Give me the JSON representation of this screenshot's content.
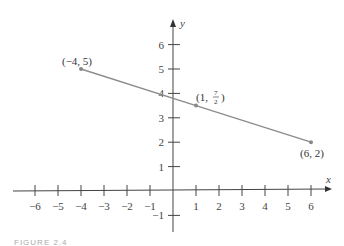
{
  "chart_data": {
    "type": "line",
    "title": "",
    "xlabel": "x",
    "ylabel": "y",
    "xlim": [
      -6.6,
      6.9
    ],
    "ylim": [
      -1.9,
      7.0
    ],
    "grid": false,
    "x_ticks": [
      -6,
      -5,
      -4,
      -3,
      -2,
      -1,
      1,
      2,
      3,
      4,
      5,
      6
    ],
    "x_tick_labels": [
      "−6",
      "−5",
      "−4",
      "−3",
      "−2",
      "−1",
      "1",
      "2",
      "3",
      "4",
      "5",
      "6"
    ],
    "y_ticks": [
      -1,
      1,
      2,
      3,
      4,
      5,
      6
    ],
    "y_tick_labels": [
      "−1",
      "1",
      "2",
      "3",
      "4",
      "5",
      "6"
    ],
    "series": [
      {
        "name": "line segment",
        "x": [
          -4,
          1,
          6
        ],
        "y": [
          5,
          3.5,
          2
        ],
        "color": "#8c8c8c"
      }
    ],
    "annotations": [
      {
        "text": "(−4, 5)",
        "x": -4,
        "y": 5
      },
      {
        "text": "(1, 7/2)",
        "x": 1,
        "y": 3.5
      },
      {
        "text": "(6, 2)",
        "x": 6,
        "y": 2
      }
    ]
  },
  "labels": {
    "point_a": "(−4, 5)",
    "point_b_prefix": "(1, ",
    "point_b_num": "7",
    "point_b_den": "2",
    "point_b_suffix": ")",
    "point_c": "(6, 2)",
    "x_axis": "x",
    "y_axis": "y"
  },
  "caption": "FIGURE 2.4"
}
